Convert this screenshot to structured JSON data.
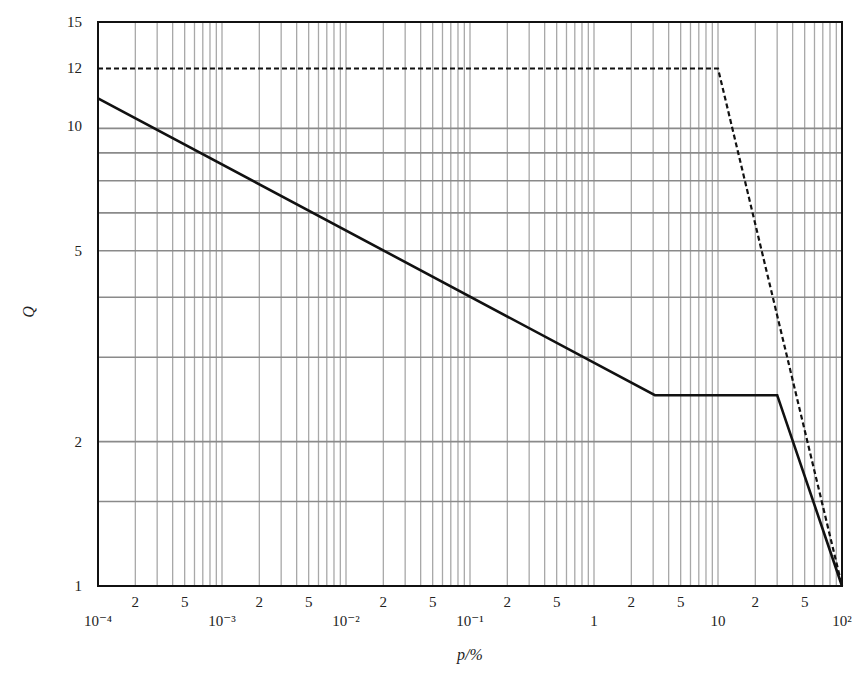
{
  "chart_data": {
    "type": "line",
    "title": "",
    "xlabel": "p/%",
    "ylabel": "Q",
    "xscale": "log",
    "yscale": "log",
    "xlim": [
      0.0001,
      100
    ],
    "ylim": [
      1,
      15
    ],
    "grid": true,
    "legend": null,
    "x_major_ticks": [
      {
        "value": 0.0001,
        "label": "10⁻⁴"
      },
      {
        "value": 0.001,
        "label": "10⁻³"
      },
      {
        "value": 0.01,
        "label": "10⁻²"
      },
      {
        "value": 0.1,
        "label": "10⁻¹"
      },
      {
        "value": 1,
        "label": "1"
      },
      {
        "value": 10,
        "label": "10"
      },
      {
        "value": 100,
        "label": "10²"
      }
    ],
    "x_minor_labels": [
      "2",
      "5"
    ],
    "y_ticks": [
      {
        "value": 1,
        "label": "1"
      },
      {
        "value": 2,
        "label": "2"
      },
      {
        "value": 5,
        "label": "5"
      },
      {
        "value": 10,
        "label": "10"
      },
      {
        "value": 12,
        "label": "12"
      },
      {
        "value": 15,
        "label": "15"
      }
    ],
    "y_gridlines": [
      1.5,
      2,
      3,
      4,
      5,
      6,
      7,
      8,
      9
    ],
    "series": [
      {
        "name": "solid",
        "style": "solid",
        "color": "#111111",
        "points": [
          [
            0.0001,
            10.4
          ],
          [
            3.1,
            2.5
          ],
          [
            30,
            2.5
          ],
          [
            100,
            1
          ]
        ]
      },
      {
        "name": "dashed",
        "style": "dashed",
        "color": "#111111",
        "points": [
          [
            0.0001,
            12
          ],
          [
            10,
            12
          ],
          [
            100,
            1
          ]
        ]
      }
    ]
  },
  "labels": {
    "xlabel": "p/%",
    "ylabel": "Q"
  },
  "colors": {
    "frame": "#111111",
    "grid": "#a8a8a8",
    "hgrid": "#8a8a8a",
    "line": "#111111"
  }
}
